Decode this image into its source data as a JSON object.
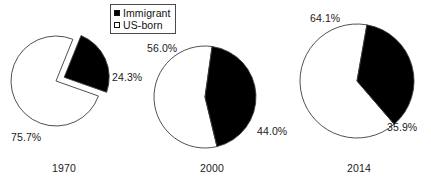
{
  "legend": {
    "entries": [
      {
        "label": "Immigrant",
        "swatch": "filled-square-icon",
        "color": "#000000"
      },
      {
        "label": "US-born",
        "swatch": "empty-square-icon",
        "color": "#ffffff"
      }
    ]
  },
  "charts": [
    {
      "year": "1970",
      "immigrant_label": "24.3%",
      "usborn_label": "75.7%"
    },
    {
      "year": "2000",
      "immigrant_label": "44.0%",
      "usborn_label": "56.0%"
    },
    {
      "year": "2014",
      "immigrant_label": "35.9%",
      "usborn_label": "64.1%"
    }
  ],
  "chart_data": {
    "type": "pie",
    "title": "",
    "subtitle": "",
    "xlabel": "",
    "ylabel": "",
    "grid": false,
    "legend_position": "top-center",
    "series_names": [
      "Immigrant",
      "US-born"
    ],
    "series_colors": [
      "#000000",
      "#ffffff"
    ],
    "panels": [
      {
        "label": "1970",
        "slices": [
          {
            "name": "Immigrant",
            "value": 24.3,
            "data_label": "24.3%",
            "color": "#000000",
            "exploded": true
          },
          {
            "name": "US-born",
            "value": 75.7,
            "data_label": "75.7%",
            "color": "#ffffff",
            "exploded": false
          }
        ]
      },
      {
        "label": "2000",
        "slices": [
          {
            "name": "Immigrant",
            "value": 44.0,
            "data_label": "44.0%",
            "color": "#000000",
            "exploded": false
          },
          {
            "name": "US-born",
            "value": 56.0,
            "data_label": "56.0%",
            "color": "#ffffff",
            "exploded": false
          }
        ]
      },
      {
        "label": "2014",
        "slices": [
          {
            "name": "Immigrant",
            "value": 35.9,
            "data_label": "35.9%",
            "color": "#000000",
            "exploded": false
          },
          {
            "name": "US-born",
            "value": 64.1,
            "data_label": "64.1%",
            "color": "#ffffff",
            "exploded": false
          }
        ]
      }
    ]
  },
  "geometry": {
    "panels": [
      {
        "cx": 56,
        "cy": 57,
        "r": 45,
        "start_deg": 22,
        "explode": 9,
        "stroke": "#3c3c3c",
        "stroke_width": 0.9
      },
      {
        "cx": 60,
        "cy": 57,
        "r": 51,
        "start_deg": 8,
        "explode": 0,
        "stroke": "#3c3c3c",
        "stroke_width": 0.9
      },
      {
        "cx": 65,
        "cy": 63,
        "r": 57,
        "start_deg": 10,
        "explode": 0,
        "stroke": "#3c3c3c",
        "stroke_width": 0.9
      }
    ]
  }
}
